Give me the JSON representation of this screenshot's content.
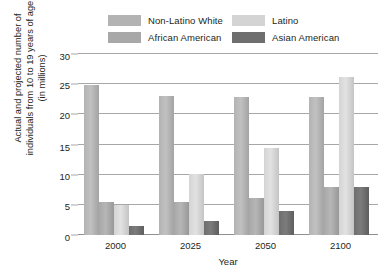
{
  "chart_data": {
    "type": "bar",
    "title": "",
    "xlabel": "Year",
    "ylabel": "Actual and projected number of individuals from 10 to 19 years of age (in millions)",
    "ylabel_lines": [
      "Actual and projected number of",
      "individuals from 10 to 19 years of age",
      "(in millions)"
    ],
    "categories": [
      "2000",
      "2025",
      "2050",
      "2100"
    ],
    "yticks": [
      0,
      5,
      10,
      15,
      20,
      25,
      30
    ],
    "ylim": [
      0,
      30
    ],
    "grid": true,
    "legend_position": "top",
    "series": [
      {
        "name": "Non-Latino White",
        "color": "#b3b3b3",
        "values": [
          24.8,
          23.0,
          22.9,
          22.9
        ]
      },
      {
        "name": "African American",
        "color": "#a8a8a8",
        "values": [
          5.4,
          5.5,
          6.2,
          8.0
        ]
      },
      {
        "name": "Latino",
        "color": "#d4d4d4",
        "values": [
          5.0,
          10.1,
          14.5,
          26.2
        ]
      },
      {
        "name": "Asian American",
        "color": "#6e6e6e",
        "values": [
          1.5,
          2.4,
          4.0,
          8.0
        ]
      }
    ]
  },
  "legend": {
    "items": [
      {
        "label": "Non-Latino White",
        "color": "#b3b3b3"
      },
      {
        "label": "Latino",
        "color": "#d4d4d4"
      },
      {
        "label": "African American",
        "color": "#a8a8a8"
      },
      {
        "label": "Asian American",
        "color": "#6e6e6e"
      }
    ]
  },
  "axes": {
    "x_title": "Year",
    "x_ticks": [
      "2000",
      "2025",
      "2050",
      "2100"
    ],
    "y_ticks": [
      "0",
      "5",
      "10",
      "15",
      "20",
      "25",
      "30"
    ],
    "y_title_line1": "Actual and projected number of",
    "y_title_line2": "individuals from 10 to 19 years of age",
    "y_title_line3": "(in millions)"
  },
  "colors": {
    "gridline": "#a7a7a7",
    "text": "#231f20",
    "background": "#ffffff"
  }
}
